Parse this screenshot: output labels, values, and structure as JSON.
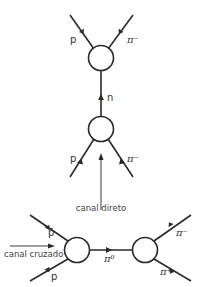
{
  "diagram": {
    "direct_channel": {
      "caption": "canal direto",
      "top_vertex": {
        "outgoing_left": "p",
        "outgoing_right": "π⁻"
      },
      "intermediate": "n",
      "bottom_vertex": {
        "incoming_left": "p",
        "incoming_right": "π⁻"
      }
    },
    "crossed_channel": {
      "caption": "canal cruzado",
      "left_vertex": {
        "incoming_top": "p̄",
        "incoming_bottom": "p"
      },
      "intermediate": "π⁰",
      "right_vertex": {
        "outgoing_top": "π⁻",
        "outgoing_bottom": "π⁺"
      }
    },
    "colors": {
      "line": "#2a2a2a",
      "text": "#333333",
      "background": "#ffffff"
    }
  }
}
